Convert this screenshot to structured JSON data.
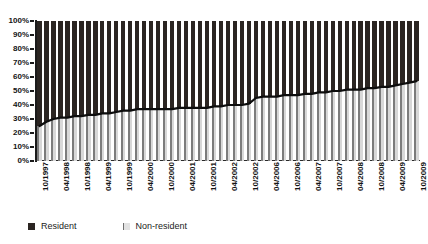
{
  "title_strip": "",
  "chart_data": {
    "type": "bar",
    "subtype": "100-percent-stacked-bar-with-boundary-line",
    "title": "",
    "subtitle": "",
    "xlabel": "",
    "ylabel": "",
    "ylim": [
      0,
      100
    ],
    "y_unit": "%",
    "grid": false,
    "legend_position": "bottom-left",
    "y_ticks": [
      "0%",
      "10%",
      "20%",
      "30%",
      "40%",
      "50%",
      "60%",
      "70%",
      "80%",
      "90%",
      "100%"
    ],
    "y_tick_values": [
      0,
      10,
      20,
      30,
      40,
      50,
      60,
      70,
      80,
      90,
      100
    ],
    "x_tick_labels": [
      "10/1997",
      "04/1998",
      "10/1998",
      "04/1999",
      "10/1999",
      "04/2000",
      "10/2000",
      "04/2001",
      "10/2001",
      "04/2002",
      "10/2002",
      "04/2006",
      "10/2006",
      "04/2007",
      "10/2007",
      "04/2008",
      "10/2008",
      "04/2009",
      "10/2009"
    ],
    "x_tick_every_n_bars": 3,
    "categories": [
      "10/1997",
      "12/1997",
      "02/1998",
      "04/1998",
      "06/1998",
      "08/1998",
      "10/1998",
      "12/1998",
      "02/1999",
      "04/1999",
      "06/1999",
      "08/1999",
      "10/1999",
      "12/1999",
      "02/2000",
      "04/2000",
      "06/2000",
      "08/2000",
      "10/2000",
      "12/2000",
      "02/2001",
      "04/2001",
      "06/2001",
      "08/2001",
      "10/2001",
      "12/2001",
      "02/2002",
      "04/2002",
      "06/2002",
      "08/2002",
      "10/2002",
      "12/2005",
      "02/2006",
      "04/2006",
      "06/2006",
      "08/2006",
      "10/2006",
      "12/2006",
      "02/2007",
      "04/2007",
      "06/2007",
      "08/2007",
      "10/2007",
      "12/2007",
      "02/2008",
      "04/2008",
      "06/2008",
      "08/2008",
      "10/2008",
      "12/2008",
      "02/2009",
      "04/2009",
      "06/2009",
      "08/2009",
      "10/2009"
    ],
    "series": [
      {
        "name": "Non-resident",
        "color": "#8f8f8f",
        "pattern": "vertical-hatch",
        "values": [
          25,
          28,
          30,
          31,
          31,
          32,
          32,
          33,
          33,
          34,
          34,
          35,
          36,
          36,
          37,
          37,
          37,
          37,
          37,
          37,
          38,
          38,
          38,
          38,
          38,
          39,
          39,
          40,
          40,
          40,
          41,
          45,
          46,
          46,
          46,
          47,
          47,
          47,
          48,
          48,
          49,
          49,
          50,
          50,
          51,
          51,
          51,
          52,
          52,
          53,
          53,
          54,
          55,
          56,
          57
        ]
      },
      {
        "name": "Resident",
        "color": "#2b2522",
        "pattern": "solid",
        "values": [
          75,
          72,
          70,
          69,
          69,
          68,
          68,
          67,
          67,
          66,
          66,
          65,
          64,
          64,
          63,
          63,
          63,
          63,
          63,
          63,
          62,
          62,
          62,
          62,
          62,
          61,
          61,
          60,
          60,
          60,
          59,
          55,
          54,
          54,
          54,
          53,
          53,
          53,
          52,
          52,
          51,
          51,
          50,
          50,
          49,
          49,
          49,
          48,
          48,
          47,
          47,
          46,
          45,
          44,
          43
        ]
      }
    ],
    "boundary_line": {
      "name": "Non-resident share",
      "color": "#0d0d0d",
      "values": [
        25,
        28,
        30,
        31,
        31,
        32,
        32,
        33,
        33,
        34,
        34,
        35,
        36,
        36,
        37,
        37,
        37,
        37,
        37,
        37,
        38,
        38,
        38,
        38,
        38,
        39,
        39,
        40,
        40,
        40,
        41,
        45,
        46,
        46,
        46,
        47,
        47,
        47,
        48,
        48,
        49,
        49,
        50,
        50,
        51,
        51,
        51,
        52,
        52,
        53,
        53,
        54,
        55,
        56,
        57
      ]
    }
  },
  "legend": {
    "items": [
      {
        "label": "Resident",
        "color": "#2b2522"
      },
      {
        "label": "Non-resident",
        "color": "#8f8f8f"
      }
    ]
  }
}
